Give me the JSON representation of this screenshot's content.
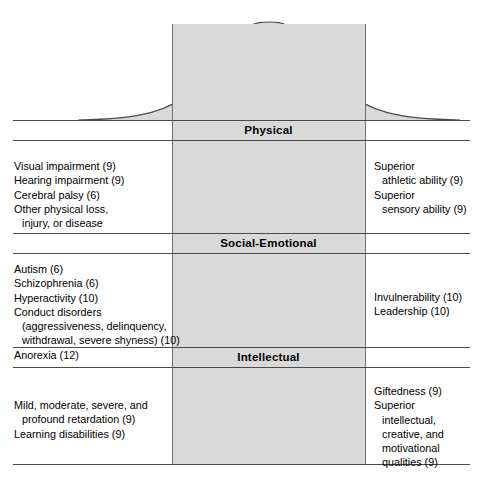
{
  "figure": {
    "curve": {
      "center_label": "\"Normality\"",
      "fill_color": "#d9d9d9",
      "stroke_color": "#4a4a4a"
    },
    "rule_color": "#4a4a4a",
    "shade_color": "#d9d9d9"
  },
  "bands": [
    {
      "title": "Physical",
      "left_items": [
        "Visual impairment (9)",
        "Hearing impairment (9)",
        "Cerebral palsy (6)",
        "Other physical loss,",
        "injury, or disease"
      ],
      "left_indent": [
        false,
        false,
        false,
        false,
        true
      ],
      "right_items": [
        "Superior",
        "athletic ability (9)",
        "Superior",
        "sensory ability (9)"
      ],
      "right_indent": [
        false,
        true,
        false,
        true
      ]
    },
    {
      "title": "Social-Emotional",
      "left_items": [
        "Autism (6)",
        "Schizophrenia (6)",
        "Hyperactivity (10)",
        "Conduct disorders",
        "(aggressiveness, delinquency,",
        "withdrawal, severe shyness) (10)",
        "Anorexia (12)"
      ],
      "left_indent": [
        false,
        false,
        false,
        false,
        true,
        true,
        false
      ],
      "right_items": [
        "Invulnerability (10)",
        "Leadership (10)"
      ],
      "right_indent": [
        false,
        false
      ]
    },
    {
      "title": "Intellectual",
      "left_items": [
        "Mild, moderate, severe, and",
        "profound retardation (9)",
        "Learning disabilities (9)"
      ],
      "left_indent": [
        false,
        true,
        false
      ],
      "right_items": [
        "Giftedness (9)",
        "Superior",
        "intellectual,",
        "creative, and",
        "motivational",
        "qualities (9)"
      ],
      "right_indent": [
        false,
        false,
        true,
        true,
        true,
        true
      ]
    }
  ]
}
